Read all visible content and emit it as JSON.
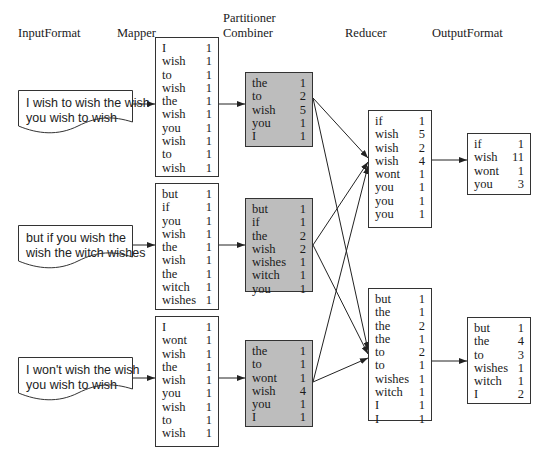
{
  "stages": {
    "input_format": "InputFormat",
    "mapper": "Mapper",
    "partitioner": "Partitioner",
    "combiner": "Combiner",
    "reducer": "Reducer",
    "output_format": "OutputFormat"
  },
  "inputs": [
    {
      "line1": "I wish to wish the wish",
      "line2": "you wish to wish"
    },
    {
      "line1": "but if you wish the",
      "line2": "wish the witch wishes"
    },
    {
      "line1": "I won't wish the wish",
      "line2": "you wish to wish"
    }
  ],
  "mappers": [
    {
      "rows": [
        [
          "I",
          "1"
        ],
        [
          "wish",
          "1"
        ],
        [
          "to",
          "1"
        ],
        [
          "wish",
          "1"
        ],
        [
          "the",
          "1"
        ],
        [
          "wish",
          "1"
        ],
        [
          "you",
          "1"
        ],
        [
          "wish",
          "1"
        ],
        [
          "to",
          "1"
        ],
        [
          "wish",
          "1"
        ]
      ]
    },
    {
      "rows": [
        [
          "but",
          "1"
        ],
        [
          "if",
          "1"
        ],
        [
          "you",
          "1"
        ],
        [
          "wish",
          "1"
        ],
        [
          "the",
          "1"
        ],
        [
          "wish",
          "1"
        ],
        [
          "the",
          "1"
        ],
        [
          "witch",
          "1"
        ],
        [
          "wishes",
          "1"
        ]
      ]
    },
    {
      "rows": [
        [
          "I",
          "1"
        ],
        [
          "wont",
          "1"
        ],
        [
          "wish",
          "1"
        ],
        [
          "the",
          "1"
        ],
        [
          "wish",
          "1"
        ],
        [
          "you",
          "1"
        ],
        [
          "wish",
          "1"
        ],
        [
          "to",
          "1"
        ],
        [
          "wish",
          "1"
        ]
      ]
    }
  ],
  "combiners": [
    {
      "rows": [
        [
          "the",
          "1"
        ],
        [
          "to",
          "2"
        ],
        [
          "wish",
          "5"
        ],
        [
          "you",
          "1"
        ],
        [
          "I",
          "1"
        ]
      ]
    },
    {
      "rows": [
        [
          "but",
          "1"
        ],
        [
          "if",
          "1"
        ],
        [
          "the",
          "2"
        ],
        [
          "wish",
          "2"
        ],
        [
          "wishes",
          "1"
        ],
        [
          "witch",
          "1"
        ],
        [
          "you",
          "1"
        ]
      ]
    },
    {
      "rows": [
        [
          "the",
          "1"
        ],
        [
          "to",
          "1"
        ],
        [
          "wont",
          "1"
        ],
        [
          "wish",
          "4"
        ],
        [
          "you",
          "1"
        ],
        [
          "I",
          "1"
        ]
      ]
    }
  ],
  "reducers": [
    {
      "rows": [
        [
          "if",
          "1"
        ],
        [
          "wish",
          "5"
        ],
        [
          "wish",
          "2"
        ],
        [
          "wish",
          "4"
        ],
        [
          "wont",
          "1"
        ],
        [
          "you",
          "1"
        ],
        [
          "you",
          "1"
        ],
        [
          "you",
          "1"
        ]
      ]
    },
    {
      "rows": [
        [
          "but",
          "1"
        ],
        [
          "the",
          "1"
        ],
        [
          "the",
          "2"
        ],
        [
          "the",
          "1"
        ],
        [
          "to",
          "2"
        ],
        [
          "to",
          "1"
        ],
        [
          "wishes",
          "1"
        ],
        [
          "witch",
          "1"
        ],
        [
          "I",
          "1"
        ],
        [
          "I",
          "1"
        ]
      ]
    }
  ],
  "outputs": [
    {
      "rows": [
        [
          "if",
          "1"
        ],
        [
          "wish",
          "11"
        ],
        [
          "wont",
          "1"
        ],
        [
          "you",
          "3"
        ]
      ]
    },
    {
      "rows": [
        [
          "but",
          "1"
        ],
        [
          "the",
          "4"
        ],
        [
          "to",
          "3"
        ],
        [
          "wishes",
          "1"
        ],
        [
          "witch",
          "1"
        ],
        [
          "I",
          "2"
        ]
      ]
    }
  ],
  "colors": {
    "combiner_fill": "#bdbdbd",
    "stroke": "#333333",
    "background": "#ffffff"
  }
}
